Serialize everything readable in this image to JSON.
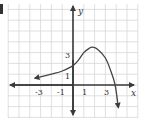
{
  "chart_data": {
    "type": "line",
    "title": "",
    "xlabel": "x",
    "ylabel": "y",
    "x_tick_labels": [
      "-3",
      "-1",
      "1",
      "3"
    ],
    "y_tick_labels": [
      "1",
      "3"
    ],
    "xlim": [
      -6,
      6
    ],
    "ylim": [
      -3,
      7
    ],
    "grid": true,
    "legend": null,
    "series": [
      {
        "name": "f(x)",
        "points": [
          [
            -3.2,
            0.7
          ],
          [
            -2,
            1.0
          ],
          [
            -1,
            1.3
          ],
          [
            0,
            1.8
          ],
          [
            0.5,
            2.3
          ],
          [
            1,
            3.0
          ],
          [
            1.5,
            3.4
          ],
          [
            1.8,
            3.5
          ],
          [
            2.3,
            3.3
          ],
          [
            3,
            2.5
          ],
          [
            3.5,
            1.3
          ],
          [
            3.9,
            0
          ],
          [
            4.2,
            -2.1
          ]
        ],
        "left_end_arrow": true,
        "right_end_arrow": true,
        "color": "#444444"
      }
    ],
    "annotations": []
  },
  "labels": {
    "x_axis": "x",
    "y_axis": "y",
    "x_ticks": [
      {
        "text": "-3",
        "value": -3
      },
      {
        "text": "-1",
        "value": -1
      },
      {
        "text": "1",
        "value": 1
      },
      {
        "text": "3",
        "value": 3
      }
    ],
    "y_ticks": [
      {
        "text": "1",
        "value": 1
      },
      {
        "text": "3",
        "value": 3
      }
    ]
  },
  "colors": {
    "grid": "#d8d8d8",
    "axis": "#3a3a3a",
    "curve": "#4a4a4a",
    "background": "#ffffff"
  }
}
